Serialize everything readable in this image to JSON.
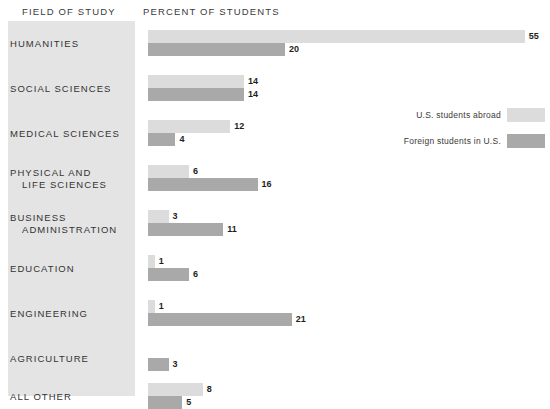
{
  "header": {
    "field_of_study": "FIELD OF STUDY",
    "percent_of_students": "PERCENT OF STUDENTS"
  },
  "legend": {
    "items": [
      {
        "label": "U.S. students abroad",
        "swatch": "light",
        "color": "#dcdcdc"
      },
      {
        "label": "Foreign students in U.S.",
        "swatch": "dark",
        "color": "#a9a9a9"
      }
    ]
  },
  "colors": {
    "panel": "#e4e4e4",
    "bar_light": "#dcdcdc",
    "bar_dark": "#a9a9a9",
    "background": "#ffffff",
    "text": "#333333"
  },
  "categories": [
    {
      "line1": "HUMANITIES",
      "line2": ""
    },
    {
      "line1": "SOCIAL SCIENCES",
      "line2": ""
    },
    {
      "line1": "MEDICAL SCIENCES",
      "line2": ""
    },
    {
      "line1": "PHYSICAL AND",
      "line2": "LIFE SCIENCES"
    },
    {
      "line1": "BUSINESS",
      "line2": "ADMINISTRATION"
    },
    {
      "line1": "EDUCATION",
      "line2": ""
    },
    {
      "line1": "ENGINEERING",
      "line2": ""
    },
    {
      "line1": "AGRICULTURE",
      "line2": ""
    },
    {
      "line1": "ALL OTHER",
      "line2": ""
    }
  ],
  "values": {
    "abroad": [
      "55",
      "14",
      "12",
      "6",
      "3",
      "1",
      "1",
      "",
      "8"
    ],
    "foreign": [
      "20",
      "14",
      "4",
      "16",
      "11",
      "6",
      "21",
      "3",
      "5"
    ]
  },
  "chart_data": {
    "type": "bar",
    "title": "",
    "subtitle": "",
    "xlabel": "PERCENT OF STUDENTS",
    "ylabel": "FIELD OF STUDY",
    "orientation": "horizontal",
    "grid": false,
    "legend_position": "right",
    "xlim": [
      0,
      58
    ],
    "categories": [
      "HUMANITIES",
      "SOCIAL SCIENCES",
      "MEDICAL SCIENCES",
      "PHYSICAL AND LIFE SCIENCES",
      "BUSINESS ADMINISTRATION",
      "EDUCATION",
      "ENGINEERING",
      "AGRICULTURE",
      "ALL OTHER"
    ],
    "series": [
      {
        "name": "U.S. students abroad",
        "color": "#dcdcdc",
        "values": [
          55,
          14,
          12,
          6,
          3,
          1,
          1,
          0,
          8
        ]
      },
      {
        "name": "Foreign students in U.S.",
        "color": "#a9a9a9",
        "values": [
          20,
          14,
          4,
          16,
          11,
          6,
          21,
          3,
          5
        ]
      }
    ],
    "units": "percent"
  }
}
